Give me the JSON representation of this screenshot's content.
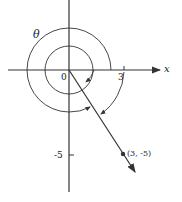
{
  "diagram": {
    "title": "",
    "axes": {
      "x_label": "x",
      "origin_label": "0",
      "x_tick_label": "3",
      "y_tick_label": "-5"
    },
    "angle_label": "θ",
    "point_label": "(3, -5)",
    "colors": {
      "stroke": "#333333",
      "background": "#ffffff"
    }
  }
}
